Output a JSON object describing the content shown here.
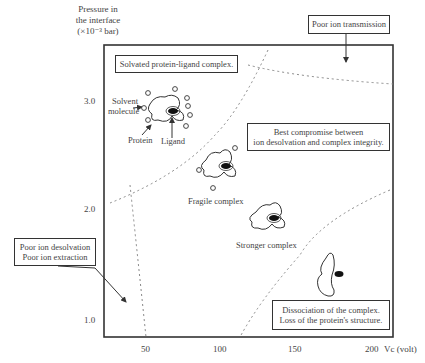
{
  "axes": {
    "y_label": [
      "Pressure in",
      "the interface",
      "(×10⁻³ bar)"
    ],
    "y_ticks": [
      "3.0",
      "2.0",
      "1.0"
    ],
    "x_ticks": [
      "50",
      "100",
      "150",
      "200"
    ],
    "x_label": "Vc (volt)"
  },
  "regions": {
    "poor_transmission": "Poor ion transmission",
    "solvated": "Solvated protein-ligand complex.",
    "best_compromise": [
      "Best compromise between",
      "ion desolvation and complex integrity."
    ],
    "poor_desolvation": [
      "Poor ion desolvation",
      "Poor ion extraction"
    ],
    "dissociation": [
      "Dissociation of the complex.",
      "Loss of the protein's structure."
    ]
  },
  "annotations": {
    "solvent": [
      "Solvent",
      "molecule"
    ],
    "protein": "Protein",
    "ligand": "Ligand",
    "fragile": "Fragile complex",
    "stronger": "Stronger complex"
  },
  "colors": {
    "frame": "#333333",
    "dashed": "#888888",
    "text": "#444444"
  }
}
